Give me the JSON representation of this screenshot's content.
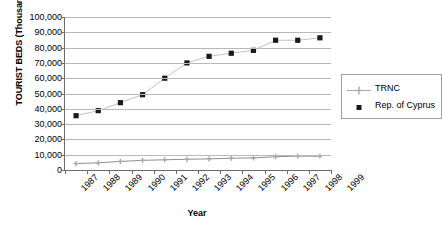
{
  "chart_data": {
    "type": "line",
    "title": "",
    "xlabel": "Year",
    "ylabel": "TOURIST BEDS (Thousands)",
    "categories": [
      "1987",
      "1988",
      "1989",
      "1990",
      "1991",
      "1992",
      "1993",
      "1994",
      "1995",
      "1996",
      "1997",
      "1998"
    ],
    "x_tick_labels": [
      "1987",
      "1988",
      "1989",
      "1990",
      "1991",
      "1992",
      "1993",
      "1994",
      "1995",
      "1996",
      "1997",
      "1998",
      "1999"
    ],
    "y_tick_labels": [
      "100,000",
      "90,000",
      "80,000",
      "70,000",
      "60,000",
      "50,000",
      "40,000",
      "30,000",
      "20,000",
      "10,000",
      "0"
    ],
    "y_ticks": [
      100000,
      90000,
      80000,
      70000,
      60000,
      50000,
      40000,
      30000,
      20000,
      10000,
      0
    ],
    "ylim": [
      0,
      100000
    ],
    "grid": true,
    "legend_position": "right",
    "series": [
      {
        "name": "TRNC",
        "marker": "cross",
        "color": "#a8a8a8",
        "values": [
          4200,
          4700,
          5600,
          6300,
          6700,
          7000,
          7300,
          7700,
          7900,
          8700,
          9100,
          9000
        ]
      },
      {
        "name": "Rep. of Cyprus",
        "marker": "square",
        "color": "#1a1a1a",
        "values": [
          35500,
          38800,
          44000,
          49200,
          60000,
          70000,
          74300,
          76300,
          78200,
          84800,
          84800,
          86400
        ]
      }
    ]
  },
  "legend": {
    "entries": [
      {
        "label": "TRNC"
      },
      {
        "label": "Rep. of Cyprus"
      }
    ]
  },
  "colors": {
    "axis": "#6b6b6b",
    "gridline": "#b9b9b9",
    "trnc": "#a8a8a8",
    "cyprus": "#1a1a1a",
    "background": "#ffffff"
  }
}
